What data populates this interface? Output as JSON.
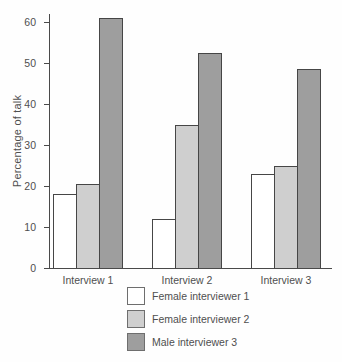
{
  "chart_data": {
    "type": "bar",
    "title": "",
    "xlabel": "",
    "ylabel": "Percentage of talk",
    "categories": [
      "Interview 1",
      "Interview 2",
      "Interview 3"
    ],
    "series": [
      {
        "name": "Female interviewer 1",
        "fill": "#ffffff",
        "values": [
          18,
          12,
          23
        ]
      },
      {
        "name": "Female interviewer 2",
        "fill": "#cfcfcf",
        "values": [
          20.5,
          35,
          25
        ]
      },
      {
        "name": "Male interviewer 3",
        "fill": "#9e9e9e",
        "values": [
          61,
          52.5,
          48.5
        ]
      }
    ],
    "ylim": [
      0,
      62
    ],
    "yticks": [
      0,
      10,
      20,
      30,
      40,
      50,
      60
    ],
    "grid": false,
    "legend_position": "bottom-left",
    "colors": {
      "axis": "#4a4a4a",
      "bar_border": "#464646",
      "text": "#4f4f4f",
      "background": "#ffffff"
    }
  }
}
